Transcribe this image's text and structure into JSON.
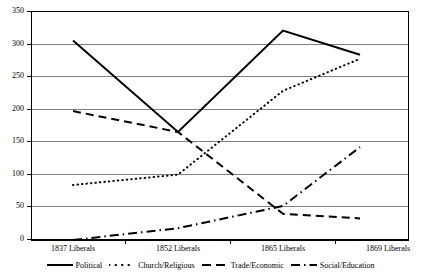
{
  "chart_data": {
    "type": "line",
    "title": "",
    "subtitle": "",
    "xlabel": "",
    "ylabel": "",
    "categories": [
      "1837 Liberals",
      "1852 Liberals",
      "1865 Liberals",
      "1869 Liberals"
    ],
    "ylim": [
      0,
      350
    ],
    "yticks": [
      0,
      50,
      100,
      150,
      200,
      250,
      300,
      350
    ],
    "ytick_labels": [
      "0",
      "50",
      "100",
      "150",
      "200",
      "250",
      "300",
      "350"
    ],
    "grid": "horizontal",
    "legend_position": "bottom",
    "series": [
      {
        "name": "Political",
        "style": "solid",
        "color": "#000000",
        "values": [
          305,
          165,
          320,
          283
        ]
      },
      {
        "name": "Church/Religious",
        "style": "dotted",
        "color": "#000000",
        "values": [
          84,
          100,
          228,
          277
        ]
      },
      {
        "name": "Trade/Economic",
        "style": "dashed",
        "color": "#000000",
        "values": [
          197,
          165,
          40,
          33
        ]
      },
      {
        "name": "Social/Education",
        "style": "dash-dot",
        "color": "#000000",
        "values": [
          0,
          18,
          52,
          142
        ]
      }
    ]
  },
  "axis": {
    "ytick_labels": [
      "350",
      "300",
      "250",
      "200",
      "150",
      "100",
      "50",
      "0"
    ],
    "xtick_labels": [
      "1837 Liberals",
      "1852 Liberals",
      "1865 Liberals",
      "1869 Liberals"
    ]
  },
  "legend": {
    "items": [
      {
        "label": "Political",
        "style": "solid"
      },
      {
        "label": "Church/Religious",
        "style": "dotted"
      },
      {
        "label": "Trade/Economic",
        "style": "dashed"
      },
      {
        "label": "Social/Education",
        "style": "dash-dot"
      }
    ]
  },
  "colors": {
    "ink": "#000000",
    "gridline": "#808080",
    "plot_background": "#ffffff"
  }
}
